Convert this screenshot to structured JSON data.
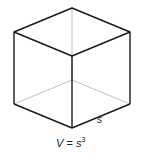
{
  "diagram": {
    "shape": "cube",
    "side_label": "s",
    "formula": {
      "lhs": "V",
      "eq": " = ",
      "base": "s",
      "exponent": "3"
    },
    "colors": {
      "edge": "#1a1a1a",
      "hidden_edge": "#b0b0b0"
    }
  }
}
